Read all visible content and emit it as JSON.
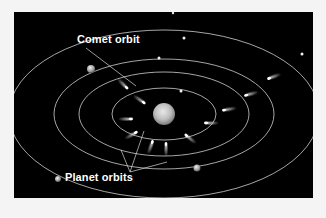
{
  "diagram": {
    "background": "#000000",
    "page_background": "#f4f4f4",
    "orbit_color": "#cfcfcf",
    "labels": {
      "comet_orbit": "Comet orbit",
      "planet_orbits": "Planet orbits"
    },
    "sun": {
      "cx": 150,
      "cy": 102,
      "r": 11
    },
    "orbits": [
      {
        "name": "inner-orbit",
        "rx": 52,
        "ry": 26
      },
      {
        "name": "second-orbit",
        "rx": 85,
        "ry": 42
      },
      {
        "name": "third-orbit",
        "rx": 110,
        "ry": 55
      },
      {
        "name": "outer-orbit",
        "rx": 155,
        "ry": 84
      }
    ],
    "planets": [
      {
        "name": "planet-upper-left",
        "cx": 77,
        "cy": 57,
        "r": 4
      },
      {
        "name": "planet-lower-left",
        "cx": 44,
        "cy": 167,
        "r": 3
      },
      {
        "name": "planet-lower-right",
        "cx": 183,
        "cy": 156,
        "r": 3.5
      }
    ],
    "comets": [
      {
        "cx": 112,
        "cy": 75,
        "angle": 45
      },
      {
        "cx": 129,
        "cy": 90,
        "angle": 35
      },
      {
        "cx": 116,
        "cy": 107,
        "angle": 0
      },
      {
        "cx": 121,
        "cy": 121,
        "angle": -30
      },
      {
        "cx": 138,
        "cy": 131,
        "angle": -70
      },
      {
        "cx": 152,
        "cy": 133,
        "angle": -90
      },
      {
        "cx": 173,
        "cy": 124,
        "angle": -140
      },
      {
        "cx": 193,
        "cy": 111,
        "angle": 180
      },
      {
        "cx": 211,
        "cy": 98,
        "angle": 170
      },
      {
        "cx": 233,
        "cy": 83,
        "angle": 165
      },
      {
        "cx": 256,
        "cy": 66,
        "angle": 160
      }
    ],
    "dots": [
      {
        "cx": 145,
        "cy": 46,
        "r": 1.5
      },
      {
        "cx": 167,
        "cy": 79,
        "r": 1.5
      },
      {
        "cx": 170,
        "cy": 26,
        "r": 1.5
      },
      {
        "cx": 288,
        "cy": 42,
        "r": 1.5
      },
      {
        "cx": 159,
        "cy": 1,
        "r": 1.2
      }
    ]
  }
}
